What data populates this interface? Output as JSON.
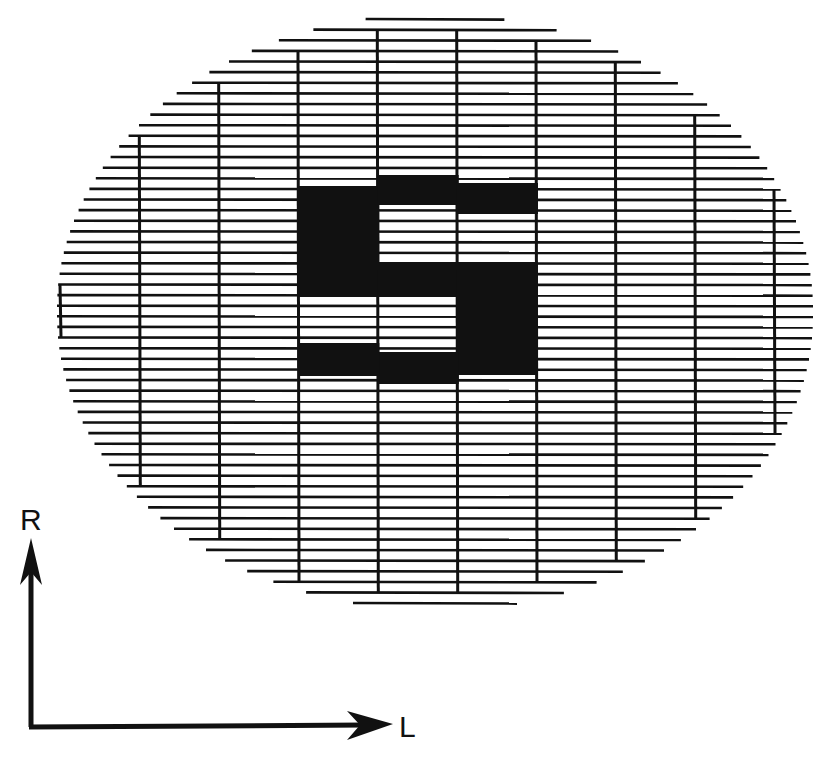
{
  "figure": {
    "ink_color": "#111111",
    "background_color": "#ffffff",
    "raster": {
      "horizontal_line_count": 56,
      "vertical_column_count": 10
    },
    "pattern": {
      "letter": "S",
      "columns": 3,
      "rows": 6,
      "cells_filled": [
        [
          1,
          1,
          1
        ],
        [
          1,
          0,
          0
        ],
        [
          1,
          1,
          1
        ],
        [
          0,
          0,
          1
        ],
        [
          1,
          1,
          1
        ],
        [
          0,
          1,
          0
        ]
      ]
    }
  },
  "axes": {
    "vertical_label": "R",
    "horizontal_label": "L",
    "vertical_direction": "up",
    "horizontal_direction": "right"
  }
}
